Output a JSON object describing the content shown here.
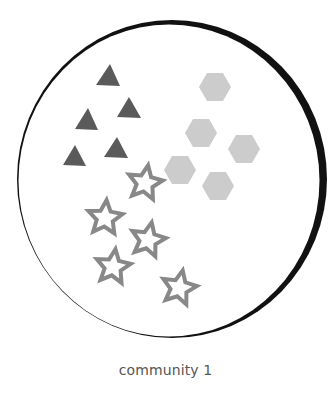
{
  "caption": "community 1",
  "colors": {
    "background": "#ffffff",
    "boundary": "#111111",
    "triangle": "#5a5a5a",
    "hexagon": "#cccccc",
    "star_stroke": "#888888",
    "caption": "#555555"
  },
  "community": {
    "label": "community 1",
    "members": {
      "triangles": [
        {
          "apex": [
            110,
            64
          ],
          "left": [
            96,
            85
          ],
          "right": [
            120,
            86
          ]
        },
        {
          "apex": [
            129,
            97
          ],
          "left": [
            117,
            117
          ],
          "right": [
            141,
            118
          ]
        },
        {
          "apex": [
            88,
            108
          ],
          "left": [
            75,
            129
          ],
          "right": [
            98,
            130
          ]
        },
        {
          "apex": [
            117,
            137
          ],
          "left": [
            104,
            157
          ],
          "right": [
            128,
            158
          ]
        },
        {
          "apex": [
            75,
            145
          ],
          "left": [
            63,
            165
          ],
          "right": [
            86,
            166
          ]
        }
      ],
      "hexagons": [
        {
          "cx": 215,
          "cy": 87
        },
        {
          "cx": 201,
          "cy": 133
        },
        {
          "cx": 244,
          "cy": 149
        },
        {
          "cx": 180,
          "cy": 170
        },
        {
          "cx": 218,
          "cy": 186
        }
      ],
      "stars": [
        {
          "cx": 145,
          "cy": 183,
          "rot": 10
        },
        {
          "cx": 105,
          "cy": 218,
          "rot": 5
        },
        {
          "cx": 148,
          "cy": 240,
          "rot": 12
        },
        {
          "cx": 113,
          "cy": 267,
          "rot": 8
        },
        {
          "cx": 179,
          "cy": 288,
          "rot": 12
        }
      ]
    }
  }
}
